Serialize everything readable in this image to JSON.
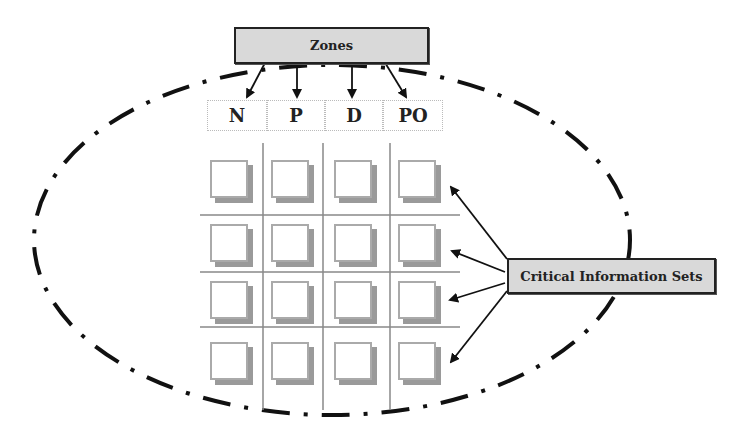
{
  "diagram": {
    "zones_label": "Zones",
    "critical_label": "Critical Information Sets",
    "zones": [
      {
        "label": "N"
      },
      {
        "label": "P"
      },
      {
        "label": "D"
      },
      {
        "label": "PO"
      }
    ],
    "grid": {
      "rows": 4,
      "columns": 4
    },
    "colors": {
      "box_fill": "#d9d9d9",
      "line": "#222222",
      "grid_line": "#888888",
      "square_shadow": "#9a9a9a"
    }
  }
}
